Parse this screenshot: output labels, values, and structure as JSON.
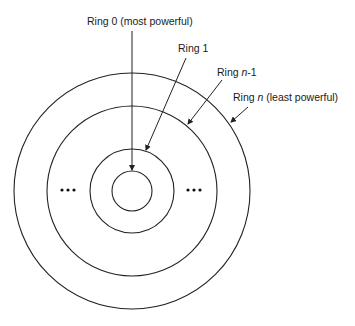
{
  "diagram": {
    "type": "concentric-rings",
    "colors": {
      "stroke": "#222222",
      "background": "#ffffff"
    },
    "labels": {
      "ring0": {
        "prefix": "Ring 0 ",
        "suffix": "(most powerful)"
      },
      "ring1": {
        "prefix": "Ring 1",
        "suffix": ""
      },
      "ring_n_minus_1": {
        "prefix": "Ring ",
        "var": "n",
        "suffix": "-1"
      },
      "ring_n": {
        "prefix": "Ring ",
        "var": "n",
        "suffix": " (least powerful)"
      }
    },
    "ellipsis_left": "•••",
    "ellipsis_right": "•••",
    "rings": [
      {
        "name": "Ring 0",
        "radius": 20
      },
      {
        "name": "Ring 1",
        "radius": 42
      },
      {
        "name": "Ring n-1",
        "radius": 85
      },
      {
        "name": "Ring n",
        "radius": 118
      }
    ]
  }
}
